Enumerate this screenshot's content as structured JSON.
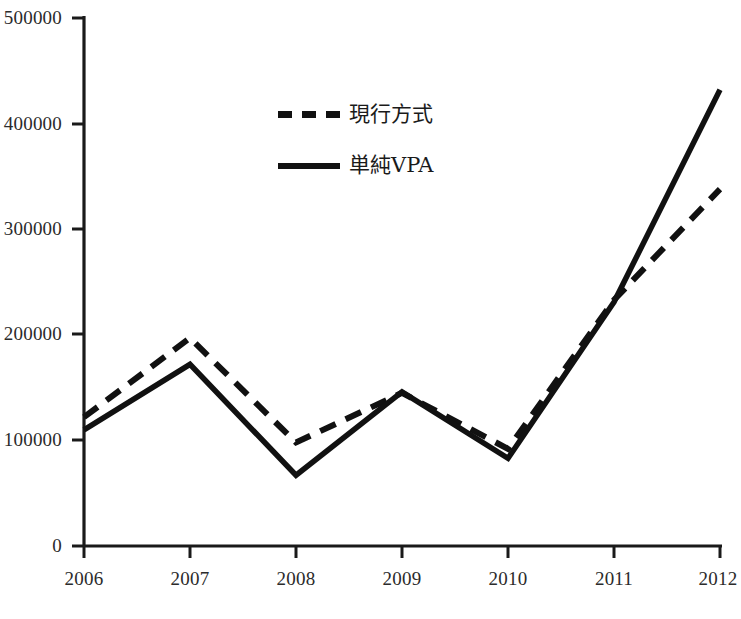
{
  "chart_data": {
    "type": "line",
    "title": "",
    "subtitle": "",
    "xlabel": "",
    "ylabel": "",
    "categories": [
      "2006",
      "2007",
      "2008",
      "2009",
      "2010",
      "2011",
      "2012"
    ],
    "x": [
      2006,
      2007,
      2008,
      2009,
      2010,
      2011,
      2012
    ],
    "series": [
      {
        "name": "現行方式",
        "style": "dashed",
        "color": "#111111",
        "values": [
          122000,
          197000,
          98000,
          145000,
          92000,
          233000,
          338000
        ]
      },
      {
        "name": "単純VPA",
        "style": "solid",
        "color": "#111111",
        "values": [
          110000,
          172000,
          67000,
          146000,
          83000,
          231000,
          432000
        ]
      }
    ],
    "ylim": [
      0,
      500000
    ],
    "yticks": [
      0,
      100000,
      200000,
      300000,
      400000,
      500000
    ],
    "ytick_labels": [
      "0",
      "100000",
      "200000",
      "300000",
      "400000",
      "500000"
    ],
    "xtick_labels": [
      "2006",
      "2007",
      "2008",
      "2009",
      "2010",
      "2011",
      "2012"
    ],
    "grid": false,
    "legend_position": "upper-center"
  },
  "legend": {
    "entries": [
      {
        "label": "現行方式",
        "style": "dashed"
      },
      {
        "label": "単純VPA",
        "style": "solid"
      }
    ]
  },
  "axes": {
    "y_labels": [
      "500000",
      "400000",
      "300000",
      "200000",
      "100000",
      "0"
    ],
    "x_labels": [
      "2006",
      "2007",
      "2008",
      "2009",
      "2010",
      "2011",
      "2012"
    ]
  }
}
